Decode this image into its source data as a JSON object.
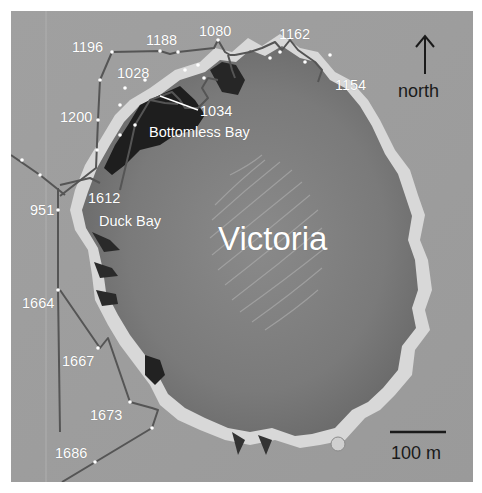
{
  "figure": {
    "crater_name": "Victoria",
    "features": {
      "bottomless_bay": "Bottomless Bay",
      "duck_bay": "Duck Bay"
    },
    "north_label": "north",
    "scale_bar_label": "100 m",
    "sol_labels": [
      {
        "id": "sol-1196",
        "text": "1196"
      },
      {
        "id": "sol-1188",
        "text": "1188"
      },
      {
        "id": "sol-1080",
        "text": "1080"
      },
      {
        "id": "sol-1162",
        "text": "1162"
      },
      {
        "id": "sol-1028",
        "text": "1028"
      },
      {
        "id": "sol-1154",
        "text": "1154"
      },
      {
        "id": "sol-1034",
        "text": "1034"
      },
      {
        "id": "sol-1200",
        "text": "1200"
      },
      {
        "id": "sol-1612",
        "text": "1612"
      },
      {
        "id": "sol-951",
        "text": "951"
      },
      {
        "id": "sol-1664",
        "text": "1664"
      },
      {
        "id": "sol-1667",
        "text": "1667"
      },
      {
        "id": "sol-1673",
        "text": "1673"
      },
      {
        "id": "sol-1686",
        "text": "1686"
      }
    ],
    "colors": {
      "terrain": "#9a9a9a",
      "crater_floor": "#7e7e7e",
      "shadow": "#1e1e1e",
      "rim_highlight": "#e8e8e8",
      "traverse_line": "#5a5a5a",
      "label_light": "#ffffff",
      "label_dark": "#1a1a1a"
    }
  }
}
